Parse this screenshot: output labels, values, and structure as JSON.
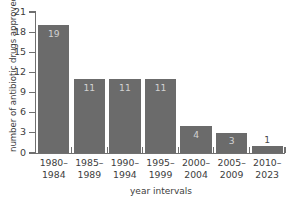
{
  "chart_data": {
    "type": "bar",
    "title": "",
    "xlabel": "year intervals",
    "ylabel": "number of antibiotic drugs approved",
    "categories": [
      "1980–1984",
      "1985–1989",
      "1990–1994",
      "1995–1999",
      "2000–2004",
      "2005–2009",
      "2010–2023"
    ],
    "category_lines": [
      {
        "top": "1980–",
        "bottom": "1984"
      },
      {
        "top": "1985–",
        "bottom": "1989"
      },
      {
        "top": "1990–",
        "bottom": "1994"
      },
      {
        "top": "1995–",
        "bottom": "1999"
      },
      {
        "top": "2000–",
        "bottom": "2004"
      },
      {
        "top": "2005–",
        "bottom": "2009"
      },
      {
        "top": "2010–",
        "bottom": "2023"
      }
    ],
    "values": [
      19,
      11,
      11,
      11,
      4,
      3,
      1
    ],
    "value_labels": [
      "19",
      "11",
      "11",
      "11",
      "4",
      "3",
      "1"
    ],
    "label_placement": [
      "inside",
      "inside",
      "inside",
      "inside",
      "inside",
      "inside",
      "outside"
    ],
    "ylim": [
      0,
      21
    ],
    "yticks": [
      0,
      3,
      6,
      9,
      12,
      15,
      18,
      21
    ],
    "ytick_labels": [
      "0",
      "3",
      "6",
      "9",
      "12",
      "15",
      "18",
      "21"
    ],
    "grid": false,
    "legend": null,
    "colors": {
      "bar_fill": "#6b6b6b",
      "axis": "#6f6f6f",
      "text": "#3d3d3d",
      "label_inside": "#d2d2d2",
      "label_outside": "#4a4a4a",
      "background": "#ffffff"
    }
  }
}
